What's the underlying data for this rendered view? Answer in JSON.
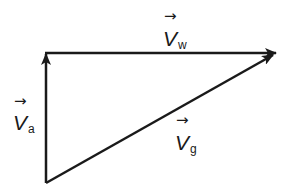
{
  "diagram": {
    "type": "vector-triangle",
    "colors": {
      "stroke": "#1a1a1a",
      "background": "#ffffff"
    },
    "vectors": [
      {
        "id": "va",
        "symbol": "V",
        "subscript": "a",
        "arrow": "→",
        "from": [
          46,
          183
        ],
        "to": [
          46,
          53
        ]
      },
      {
        "id": "vw",
        "symbol": "V",
        "subscript": "w",
        "arrow": "→",
        "from": [
          46,
          53
        ],
        "to": [
          276,
          53
        ]
      },
      {
        "id": "vg",
        "symbol": "V",
        "subscript": "g",
        "arrow": "→",
        "from": [
          46,
          183
        ],
        "to": [
          272,
          55
        ]
      }
    ]
  }
}
